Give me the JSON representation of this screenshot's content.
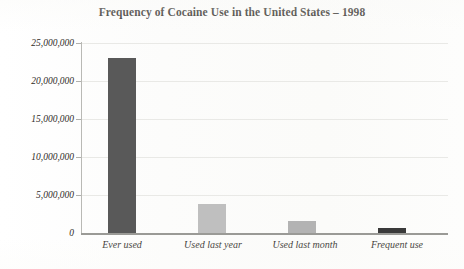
{
  "chart_data": {
    "type": "bar",
    "title": "Frequency of Cocaine Use in the United States – 1998",
    "xlabel": "",
    "ylabel": "",
    "categories": [
      "Ever used",
      "Used last year",
      "Used last month",
      "Frequent use"
    ],
    "values": [
      23000000,
      3800000,
      1600000,
      600000
    ],
    "series": [
      {
        "name": "Frequency of cocaine use",
        "values": [
          23000000,
          3800000,
          1600000,
          600000
        ]
      }
    ],
    "bar_colors": [
      "#595959",
      "#bfbfbf",
      "#b3b3b3",
      "#3a3a3a"
    ],
    "ylim": [
      0,
      25000000
    ],
    "ytick_values": [
      25000000,
      20000000,
      15000000,
      10000000,
      5000000,
      0
    ],
    "ytick_labels": [
      "25,000,000",
      "20,000,000",
      "15,000,000",
      "10,000,000",
      "5,000,000",
      "0"
    ],
    "grid": true,
    "grid_axis": "y",
    "legend": false,
    "legend_position": "none",
    "background_color": "#fdfdfc",
    "axis_color": "#9a9a96",
    "gridline_color": "#e9e9e6",
    "text_color": "#2a2722"
  }
}
